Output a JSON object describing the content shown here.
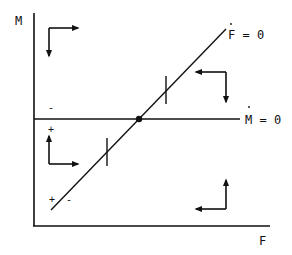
{
  "diagram": {
    "type": "phase-diagram",
    "axes": {
      "y_label": "M",
      "x_label": "F"
    },
    "loci": [
      {
        "name": "F-dot-zero",
        "label": "F = 0",
        "dot_over": "F",
        "shape": "upward-sloping line"
      },
      {
        "name": "M-dot-zero",
        "label": "M = 0",
        "dot_over": "M",
        "shape": "horizontal line"
      }
    ],
    "equilibrium": {
      "shape": "filled-circle",
      "at": "intersection of loci"
    },
    "signs": {
      "above_m_line": "-",
      "below_m_line": "+",
      "left_of_f_line": "+",
      "right_of_f_line": "-"
    },
    "direction_arrows": [
      {
        "region": "top-left",
        "horizontal": "right",
        "vertical": "down"
      },
      {
        "region": "top-right",
        "horizontal": "left",
        "vertical": "down"
      },
      {
        "region": "bottom-left",
        "horizontal": "right",
        "vertical": "up"
      },
      {
        "region": "bottom-right",
        "horizontal": "left",
        "vertical": "up"
      }
    ],
    "colors": {
      "ink": "#111111",
      "background": "#ffffff"
    }
  }
}
